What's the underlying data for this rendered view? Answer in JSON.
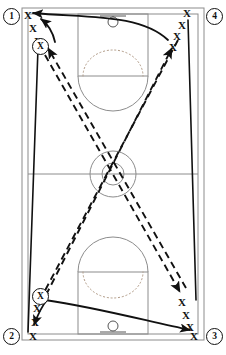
{
  "diagram": {
    "type": "basketball-full-court-drill",
    "court": {
      "outline_color": "#8c8c8c",
      "line_color": "#8c8c8c",
      "background": "#ffffff",
      "border": {
        "x": 22,
        "y": 8,
        "width": 182,
        "height": 332
      },
      "inner_border": {
        "x": 28,
        "y": 14,
        "width": 170,
        "height": 320
      },
      "halfcourt_line_y": 174,
      "center_circle": {
        "cx": 113,
        "cy": 174,
        "r_outer": 23,
        "r_inner": 11
      },
      "top_key": {
        "x": 78,
        "y": 14,
        "width": 70,
        "height": 62
      },
      "bottom_key": {
        "x": 78,
        "y": 272,
        "width": 70,
        "height": 62
      },
      "top_hoop": {
        "cx": 113,
        "cy": 22,
        "r": 5
      },
      "bottom_hoop": {
        "cx": 113,
        "cy": 326,
        "r": 5
      },
      "top_backboard": {
        "x1": 100,
        "y1": 16,
        "x2": 126,
        "y2": 16
      },
      "bottom_backboard": {
        "x1": 100,
        "y1": 332,
        "x2": 126,
        "y2": 332
      }
    },
    "stations": [
      {
        "id": "station-1",
        "label": "1",
        "x": 3,
        "y": 8,
        "corner": "top-left"
      },
      {
        "id": "station-4",
        "label": "4",
        "x": 206,
        "y": 8,
        "corner": "top-right"
      },
      {
        "id": "station-2",
        "label": "2",
        "x": 3,
        "y": 328,
        "corner": "bottom-left"
      },
      {
        "id": "station-3",
        "label": "3",
        "x": 206,
        "y": 328,
        "corner": "bottom-right"
      }
    ],
    "player_queues": [
      {
        "queue": "top-left",
        "marks": [
          {
            "label": "X",
            "x": 24,
            "y": 10
          },
          {
            "label": "X",
            "x": 29,
            "y": 23
          },
          {
            "label": "X",
            "x": 34,
            "y": 36
          }
        ]
      },
      {
        "queue": "top-right",
        "marks": [
          {
            "label": "X",
            "x": 183,
            "y": 8
          },
          {
            "label": "X",
            "x": 178,
            "y": 20
          },
          {
            "label": "X",
            "x": 173,
            "y": 31
          },
          {
            "label": "X",
            "x": 169,
            "y": 42
          }
        ]
      },
      {
        "queue": "bottom-left",
        "marks": [
          {
            "label": "X",
            "x": 33,
            "y": 303
          },
          {
            "label": "X",
            "x": 31,
            "y": 317
          },
          {
            "label": "X",
            "x": 29,
            "y": 331
          }
        ]
      },
      {
        "queue": "bottom-right",
        "marks": [
          {
            "label": "X",
            "x": 178,
            "y": 297
          },
          {
            "label": "X",
            "x": 182,
            "y": 310
          },
          {
            "label": "X",
            "x": 186,
            "y": 322
          },
          {
            "label": "X",
            "x": 190,
            "y": 331
          }
        ]
      }
    ],
    "ball_handlers": [
      {
        "id": "ball-handler-top",
        "label": "X",
        "x": 32,
        "y": 38
      },
      {
        "id": "ball-handler-bottom",
        "label": "X",
        "x": 32,
        "y": 288
      }
    ],
    "pass_lines": [
      {
        "id": "pass-topleft-to-bottomright",
        "style": "dashed",
        "path": "M 45 55 L 180 292",
        "arrow_at": "end"
      },
      {
        "id": "pass-bottomleft-to-topright",
        "style": "dashed",
        "path": "M 46 295 L 172 48",
        "arrow_at": "end"
      },
      {
        "id": "pass-topright-to-bottomleft",
        "style": "dashed",
        "path": "M 178 40 L 40 300",
        "arrow_at": "end"
      },
      {
        "id": "pass-bottomright-to-topleft",
        "style": "dashed",
        "path": "M 186 288 L 48 48",
        "arrow_at": "end"
      }
    ],
    "movement_lines": [
      {
        "id": "cut-topright-to-topleft",
        "style": "solid",
        "path": "M 168 40 C 140 14 90 18 33 13",
        "arrow_at": "end"
      },
      {
        "id": "cut-bottomleft-to-bottomright",
        "style": "solid",
        "path": "M 45 300 C 100 308 150 322 190 330",
        "arrow_at": "end"
      },
      {
        "id": "run-left-sideline",
        "style": "solid",
        "path": "M 38 48 L 28 332",
        "arrow_at": "none"
      },
      {
        "id": "run-right-sideline",
        "style": "solid",
        "path": "M 188 20 L 196 300",
        "arrow_at": "none"
      },
      {
        "id": "dribble-curl-top",
        "style": "solid-curve",
        "path": "M 55 42 C 52 28 45 22 40 20",
        "arrow_at": "end"
      },
      {
        "id": "dribble-curl-bottom",
        "style": "solid-curve",
        "path": "M 47 300 C 42 306 38 314 34 325",
        "arrow_at": "end"
      }
    ],
    "legend": {
      "x_meaning": "player",
      "circled_x_meaning": "player with ball",
      "dashed_meaning": "pass",
      "solid_meaning": "player movement / cut"
    }
  }
}
